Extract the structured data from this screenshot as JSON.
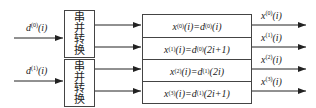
{
  "inputs": [
    {
      "base": "d",
      "sup": "(0)",
      "arg": "(i)"
    },
    {
      "base": "d",
      "sup": "(1)",
      "arg": "(i)"
    }
  ],
  "converters": [
    {
      "label": [
        "串",
        "并",
        "转",
        "换"
      ]
    },
    {
      "label": [
        "串",
        "并",
        "转",
        "换"
      ]
    }
  ],
  "table": [
    {
      "lhs": "x",
      "lsup": "(0)",
      "larg": "(i)=",
      "rbase": "d",
      "rsup": "(0)",
      "rarg": "(i)"
    },
    {
      "lhs": "x",
      "lsup": "(1)",
      "larg": "(i)=",
      "rbase": "d",
      "rsup": "(0)",
      "rarg": "(2i+1)"
    },
    {
      "lhs": "x",
      "lsup": "(2)",
      "larg": "(i)=",
      "rbase": "d",
      "rsup": "(1)",
      "rarg": "(2i)"
    },
    {
      "lhs": "x",
      "lsup": "(3)",
      "larg": "(i)=",
      "rbase": "d",
      "rsup": "(1)",
      "rarg": "(2i+1)"
    }
  ],
  "outputs": [
    {
      "base": "x",
      "sup": "(0)",
      "arg": "(i)"
    },
    {
      "base": "x",
      "sup": "(1)",
      "arg": "(i)"
    },
    {
      "base": "x",
      "sup": "(2)",
      "arg": "(i)"
    },
    {
      "base": "x",
      "sup": "(3)",
      "arg": "(i)"
    }
  ]
}
